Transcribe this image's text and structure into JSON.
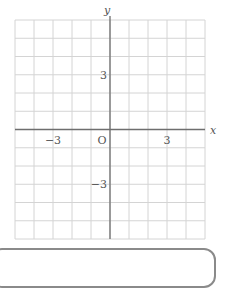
{
  "chart_data": {
    "type": "line",
    "title": "",
    "xlabel": "x",
    "ylabel": "y",
    "origin_label": "O",
    "xlim": [
      -5,
      5
    ],
    "ylim": [
      -6,
      6
    ],
    "grid": true,
    "grid_step": 1,
    "x_ticks": [
      {
        "value": -3,
        "label": "−3"
      },
      {
        "value": 3,
        "label": "3"
      }
    ],
    "y_ticks": [
      {
        "value": 3,
        "label": "3"
      },
      {
        "value": -3,
        "label": "−3"
      }
    ],
    "series": []
  },
  "style": {
    "grid_color": "#d4d4d4",
    "axis_color": "#6e6e6e",
    "text_color": "#555555"
  }
}
